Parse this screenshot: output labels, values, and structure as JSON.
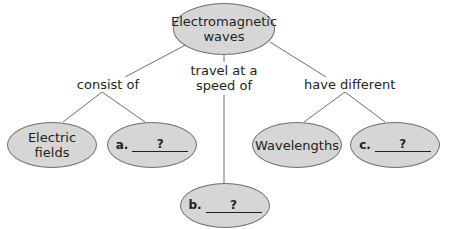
{
  "diagram": {
    "type": "concept-map",
    "root": {
      "label_line1": "Electromagnetic",
      "label_line2": "waves"
    },
    "links": [
      {
        "label": "consist of"
      },
      {
        "label_line1": "travel at a",
        "label_line2": "speed of"
      },
      {
        "label": "have different"
      }
    ],
    "nodes": {
      "electric_fields": {
        "line1": "Electric",
        "line2": "fields"
      },
      "a": {
        "letter": "a.",
        "blank": "?"
      },
      "b": {
        "letter": "b.",
        "blank": "?"
      },
      "wavelengths": {
        "label": "Wavelengths"
      },
      "c": {
        "letter": "c.",
        "blank": "?"
      }
    },
    "colors": {
      "node_fill": "#d6d6d7",
      "node_border": "#6d6e71",
      "line": "#6d6e71",
      "text": "#231f20"
    }
  }
}
